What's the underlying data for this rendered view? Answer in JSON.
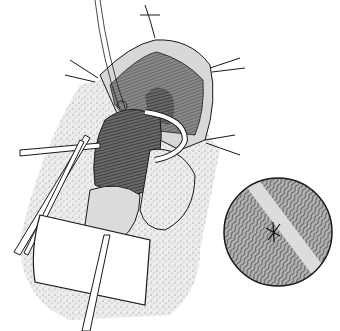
{
  "figure": {
    "type": "medical-line-illustration",
    "style": "black-and-white pen and stipple",
    "colors": {
      "background": "#ffffff",
      "ink": "#1a1a1a",
      "stipple": "#9a9a9a",
      "shade": "#555555"
    },
    "elements": [
      "retracted-incision-with-four-retractor-hooks",
      "dark-hatched-tissue-mobilized",
      "curved-white-instrument",
      "forceps-clamp-left",
      "gauze-pad-bottom",
      "catheter-drain-bottom",
      "circular-magnified-inset-fibers"
    ]
  }
}
